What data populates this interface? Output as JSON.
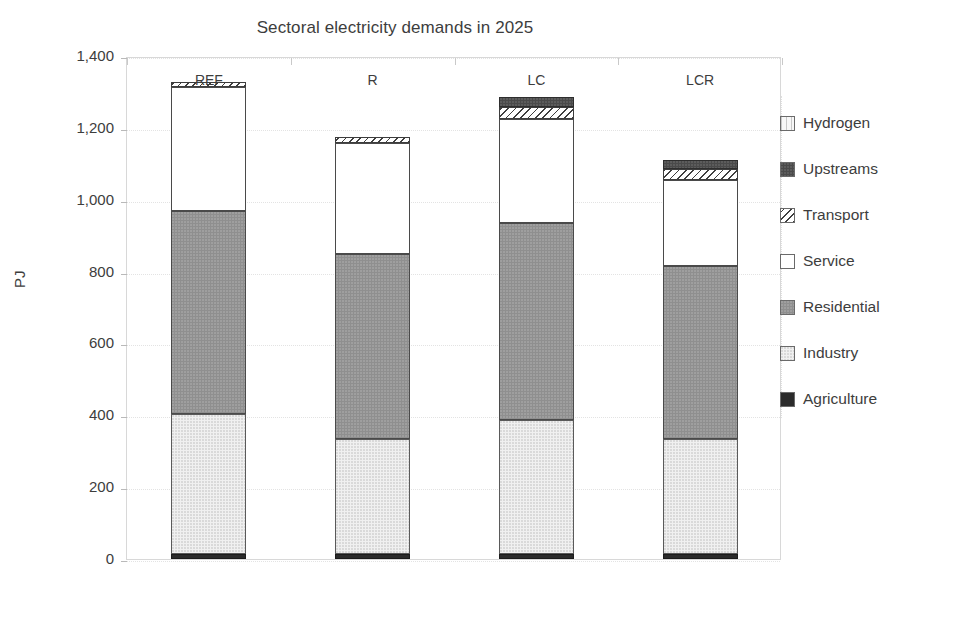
{
  "chart_data": {
    "type": "bar",
    "subtype": "stacked-column",
    "title": "Sectoral electricity demands in 2025",
    "xlabel": "",
    "ylabel": "PJ",
    "categories": [
      "REF",
      "R",
      "LC",
      "LCR"
    ],
    "ylim": [
      0,
      1400
    ],
    "ytick_values": [
      0,
      200,
      400,
      600,
      800,
      1000,
      1200,
      1400
    ],
    "ytick_labels": [
      "0",
      "200",
      "400",
      "600",
      "800",
      "1,000",
      "1,200",
      "1,400"
    ],
    "grid": true,
    "legend_position": "right",
    "stack_order_bottom_to_top": [
      "Agriculture",
      "Industry",
      "Residential",
      "Service",
      "Transport",
      "Upstreams",
      "Hydrogen"
    ],
    "series": [
      {
        "name": "Agriculture",
        "pattern": "solid-black",
        "color": "#2b2b2b",
        "values": [
          14,
          14,
          14,
          14
        ]
      },
      {
        "name": "Industry",
        "pattern": "light-speckle",
        "color": "#f0f0f0",
        "values": [
          390,
          320,
          372,
          320
        ]
      },
      {
        "name": "Residential",
        "pattern": "mid-speckle",
        "color": "#8f8f8f",
        "values": [
          565,
          515,
          548,
          482
        ]
      },
      {
        "name": "Service",
        "pattern": "empty-white",
        "color": "#ffffff",
        "values": [
          345,
          310,
          290,
          240
        ]
      },
      {
        "name": "Transport",
        "pattern": "diagonal-hatch",
        "color": "#ffffff",
        "values": [
          15,
          15,
          33,
          30
        ]
      },
      {
        "name": "Upstreams",
        "pattern": "dark-speckle",
        "color": "#4a4a4a",
        "values": [
          0,
          0,
          30,
          25
        ]
      },
      {
        "name": "Hydrogen",
        "pattern": "vertical-hatch",
        "color": "#f7f7f7",
        "values": [
          0,
          0,
          0,
          0
        ]
      }
    ],
    "totals": [
      1329,
      1174,
      1287,
      1111
    ],
    "legend_entries": [
      {
        "label": "Hydrogen",
        "swatch": "vertical-hatch"
      },
      {
        "label": "Upstreams",
        "swatch": "dark-speckle"
      },
      {
        "label": "Transport",
        "swatch": "diagonal-hatch"
      },
      {
        "label": "Service",
        "swatch": "empty-white"
      },
      {
        "label": "Residential",
        "swatch": "mid-speckle"
      },
      {
        "label": "Industry",
        "swatch": "light-speckle"
      },
      {
        "label": "Agriculture",
        "swatch": "solid-black"
      }
    ]
  }
}
